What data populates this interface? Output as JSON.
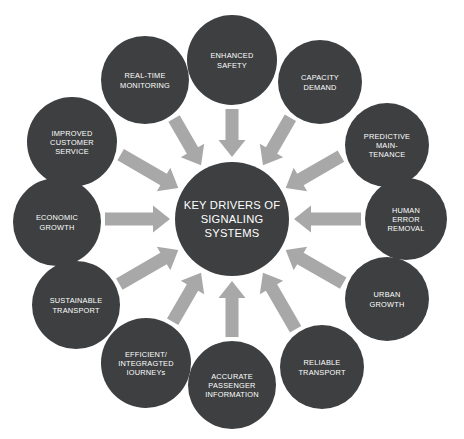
{
  "diagram": {
    "type": "radial-hub-and-spoke",
    "background_color": "#ffffff",
    "node_color": "#3d3f41",
    "arrow_color": "#a8a8a8",
    "label_color": "#ffffff",
    "arrow_count": 12,
    "arrow_direction": "inward-to-hub"
  },
  "hub": {
    "name": "key-drivers-hub",
    "lines": [
      "KEY DRIVERS OF",
      "SIGNALING",
      "SYSTEMS"
    ],
    "cx": 232,
    "cy": 219,
    "r": 57
  },
  "nodes": [
    {
      "id": "enhanced-safety",
      "lines": [
        "ENHANCED",
        "SAFETY"
      ],
      "cx": 232,
      "cy": 60,
      "r": 45,
      "angle": -90
    },
    {
      "id": "capacity-demand",
      "lines": [
        "CAPACITY",
        "DEMAND"
      ],
      "cx": 320,
      "cy": 82,
      "r": 42,
      "angle": -60
    },
    {
      "id": "predictive-maintenance",
      "lines": [
        "PREDICTIVE",
        "MAIN-",
        "TENANCE"
      ],
      "cx": 387,
      "cy": 145,
      "r": 42,
      "angle": -30
    },
    {
      "id": "human-error-removal",
      "lines": [
        "HUMAN",
        "ERROR",
        "REMOVAL"
      ],
      "cx": 406,
      "cy": 219,
      "r": 41,
      "angle": 0
    },
    {
      "id": "urban-growth",
      "lines": [
        "URBAN",
        "GROWTH"
      ],
      "cx": 387,
      "cy": 299,
      "r": 42,
      "angle": 30
    },
    {
      "id": "reliable-transport",
      "lines": [
        "RELIABLE",
        "TRANSPORT"
      ],
      "cx": 322,
      "cy": 367,
      "r": 42,
      "angle": 60
    },
    {
      "id": "accurate-passenger-information",
      "lines": [
        "ACCURATE",
        "PASSENGER",
        "INFORMATION"
      ],
      "cx": 232,
      "cy": 385,
      "r": 44,
      "angle": 90
    },
    {
      "id": "efficient-integrated-journeys",
      "lines": [
        "EFFICIENT/",
        "INTEGRAGTED",
        "IOURNEYs"
      ],
      "cx": 146,
      "cy": 363,
      "r": 45,
      "angle": 120
    },
    {
      "id": "sustainable-transport",
      "lines": [
        "SUSTAINABLE",
        "TRANSPORT"
      ],
      "cx": 76,
      "cy": 305,
      "r": 44,
      "angle": 150
    },
    {
      "id": "economic-growth",
      "lines": [
        "ECONOMIC",
        "GROWTH"
      ],
      "cx": 57,
      "cy": 222,
      "r": 44,
      "angle": 180
    },
    {
      "id": "improved-customer-service",
      "lines": [
        "IMPROVED",
        "CUSTOMER",
        "SERVICE"
      ],
      "cx": 72,
      "cy": 142,
      "r": 45,
      "angle": 210
    },
    {
      "id": "real-time-monitoring",
      "lines": [
        "REAL-TIME",
        "MONITORING"
      ],
      "cx": 145,
      "cy": 80,
      "r": 44,
      "angle": 240
    }
  ]
}
